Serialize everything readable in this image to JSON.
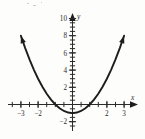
{
  "figure": {
    "name": "parabola-plot",
    "background_color": "#fdfdfc",
    "ink_color": "#1d1d1d"
  },
  "chart_data": {
    "type": "line",
    "title": "",
    "subtitle": "",
    "equation": "y = x^2 - 1",
    "xlabel": "x",
    "ylabel": "y",
    "xlim": [
      -3.6,
      3.6
    ],
    "ylim": [
      -2.6,
      11.0
    ],
    "grid": false,
    "legend": null,
    "x_ticks_labeled": [
      -3,
      -2,
      2,
      3
    ],
    "x_tick_labels": [
      "−3",
      "−2",
      "2",
      "3"
    ],
    "y_ticks_labeled": [
      -2,
      2,
      4,
      6,
      8,
      10
    ],
    "y_tick_labels": [
      "−2",
      "2",
      "4",
      "6",
      "8",
      "10"
    ],
    "minor_tick_step": 0.5,
    "vertex": [
      0,
      -1
    ],
    "roots": [
      -1,
      1
    ],
    "series": [
      {
        "name": "y = x^2 - 1",
        "arrows": "both",
        "x": [
          -3.0,
          -2.75,
          -2.5,
          -2.25,
          -2.0,
          -1.75,
          -1.5,
          -1.25,
          -1.0,
          -0.75,
          -0.5,
          -0.25,
          0.0,
          0.25,
          0.5,
          0.75,
          1.0,
          1.25,
          1.5,
          1.75,
          2.0,
          2.25,
          2.5,
          2.75,
          3.0
        ],
        "y": [
          8.0,
          6.5625,
          5.25,
          4.0625,
          3.0,
          2.0625,
          1.25,
          0.5625,
          0.0,
          -0.4375,
          -0.75,
          -0.9375,
          -1.0,
          -0.9375,
          -0.75,
          -0.4375,
          0.0,
          0.5625,
          1.25,
          2.0625,
          3.0,
          4.0625,
          5.25,
          6.5625,
          8.0
        ]
      }
    ]
  },
  "axis_label_x": "x",
  "axis_label_y": "y"
}
